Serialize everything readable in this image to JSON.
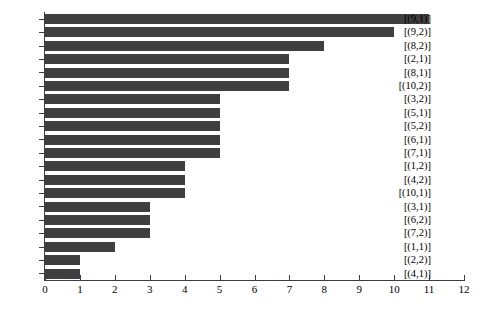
{
  "chart_data": {
    "type": "bar",
    "orientation": "horizontal",
    "title": "",
    "xlabel": "",
    "ylabel": "",
    "xlim": [
      0,
      12
    ],
    "grid": false,
    "legend": null,
    "bar_color": "#3f3f3f",
    "axis_color": "#3d3d3d",
    "xticks": [
      "0",
      "1",
      "2",
      "3",
      "4",
      "5",
      "6",
      "7",
      "8",
      "9",
      "10",
      "11",
      "12"
    ],
    "xtick_values": [
      0,
      1,
      2,
      3,
      4,
      5,
      6,
      7,
      8,
      9,
      10,
      11,
      12
    ],
    "categories": [
      "[(9,1)]",
      "[(9,2)]",
      "[(8,2)]",
      "[(2,1)]",
      "[(8,1)]",
      "[(10,2)]",
      "[(3,2)]",
      "[(5,1)]",
      "[(5,2)]",
      "[(6,1)]",
      "[(7,1)]",
      "[(1,2)]",
      "[(4,2)]",
      "[(10,1)]",
      "[(3,1)]",
      "[(6,2)]",
      "[(7,2)]",
      "[(1,1)]",
      "[(2,2)]",
      "[(4,1)]"
    ],
    "values": [
      11,
      10,
      8,
      7,
      7,
      7,
      5,
      5,
      5,
      5,
      5,
      4,
      4,
      4,
      3,
      3,
      3,
      2,
      1,
      1
    ]
  }
}
